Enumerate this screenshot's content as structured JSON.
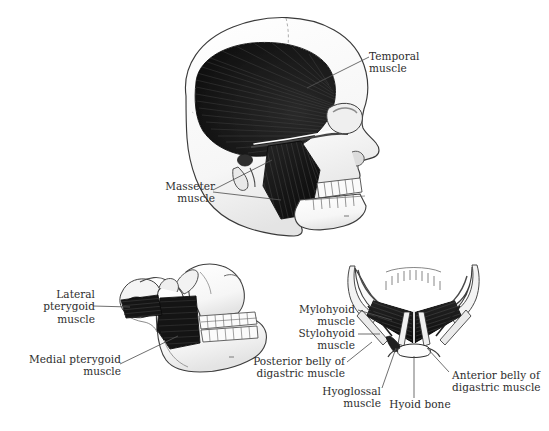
{
  "figure": {
    "background_color": "#ffffff",
    "ink_color": "#2d2d2d",
    "muscle_fill_color": "#1a1a1a",
    "bone_fill_color": "#fbfbfb"
  },
  "panels": [
    {
      "id": "lateral-skull",
      "name": "Lateral view of skull with temporal and masseter muscles"
    },
    {
      "id": "lateral-mandible",
      "name": "Lateral view of mandible with pterygoid muscles"
    },
    {
      "id": "inferior-mandible",
      "name": "Inferior view of mandible with suprahyoid muscles"
    }
  ],
  "labels": {
    "temporal_muscle": "Temporal\nmuscle",
    "masseter_muscle": "Masseter\nmuscle",
    "lateral_pterygoid_muscle": "Lateral pterygoid\nmuscle",
    "medial_pterygoid_muscle": "Medial pterygoid\nmuscle",
    "mylohyoid_muscle": "Mylohyoid\nmuscle",
    "stylohyoid_muscle": "Stylohyoid\nmuscle",
    "posterior_belly_digastric": "Posterior belly of\ndigastric muscle",
    "hyoglossal_muscle": "Hyoglossal\nmuscle",
    "hyoid_bone": "Hyoid bone",
    "anterior_belly_digastric": "Anterior belly of\ndigastric muscle"
  }
}
